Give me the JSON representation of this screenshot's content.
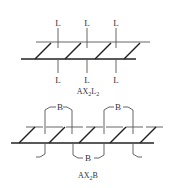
{
  "diagrams": [
    {
      "caption": "AX2L2",
      "caption_main": "AX",
      "caption_sub1": "2",
      "caption_mid": "L",
      "caption_sub2": "2",
      "ligand_label": "L",
      "top_labels": [
        "L",
        "L",
        "L"
      ],
      "bottom_labels": [
        "L",
        "L",
        "L"
      ]
    },
    {
      "caption": "AX2B",
      "caption_main": "AX",
      "caption_sub1": "2",
      "caption_mid": "B",
      "bridge_label": "B",
      "top_bridges": [
        "B",
        "B"
      ],
      "bottom_bridges": [
        "B"
      ]
    }
  ]
}
